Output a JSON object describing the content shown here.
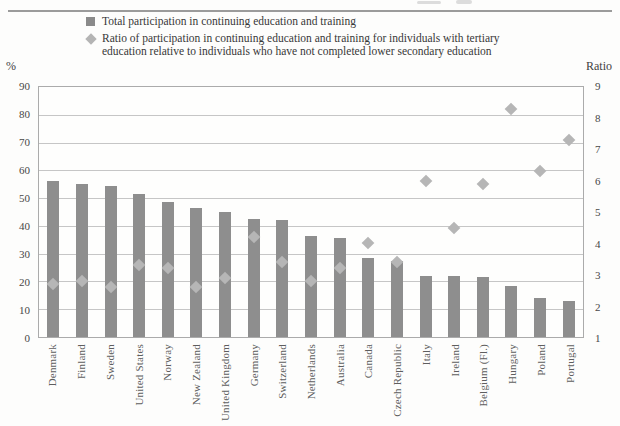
{
  "axis_titles": {
    "left": "%",
    "right": "Ratio"
  },
  "legend": {
    "items": [
      {
        "marker": "square-icon",
        "label": "Total participation in continuing education and training"
      },
      {
        "marker": "diamond-icon",
        "label_line1": "Ratio of participation in continuing education and training for individuals with tertiary",
        "label_line2": "education relative to individuals who have not completed lower secondary education"
      }
    ]
  },
  "colors": {
    "bar": "#8e8e8e",
    "diamond": "#b6b6b6",
    "gridline": "#c6c6c6",
    "plot_border": "#ababab",
    "tick_text": "#474747",
    "label_text": "#5e5e5e",
    "legend_text": "#383838",
    "top_rule": "#9b9b9b"
  },
  "chart_data": {
    "type": "bar",
    "categories": [
      "Denmark",
      "Finland",
      "Sweden",
      "United States",
      "Norway",
      "New Zealand",
      "United Kingdom",
      "Germany",
      "Switzerland",
      "Netherlands",
      "Australia",
      "Canada",
      "Czech Republic",
      "Italy",
      "Ireland",
      "Belgium (Fl.)",
      "Hungary",
      "Poland",
      "Portugal"
    ],
    "series": [
      {
        "name": "Total participation in continuing education and training",
        "type": "bar",
        "axis": "left",
        "values": [
          56,
          55,
          54.5,
          51.5,
          48.5,
          46.5,
          45,
          42.5,
          42,
          36.5,
          35.5,
          28.5,
          27.5,
          22,
          22,
          21.5,
          18.5,
          14,
          13
        ]
      },
      {
        "name": "Ratio of participation in continuing education and training for individuals with tertiary education relative to individuals who have not completed lower secondary education",
        "type": "scatter",
        "marker": "diamond",
        "axis": "right",
        "values": [
          2.7,
          2.8,
          2.6,
          3.3,
          3.2,
          2.6,
          2.9,
          4.2,
          3.4,
          2.8,
          3.2,
          4.0,
          3.4,
          6.0,
          4.5,
          5.9,
          8.3,
          6.3,
          7.3
        ]
      }
    ],
    "left_axis": {
      "label": "%",
      "min": 0,
      "max": 90,
      "ticks": [
        0,
        10,
        20,
        30,
        40,
        50,
        60,
        70,
        80,
        90
      ]
    },
    "right_axis": {
      "label": "Ratio",
      "min": 1,
      "max": 9,
      "ticks": [
        1,
        2,
        3,
        4,
        5,
        6,
        7,
        8,
        9
      ]
    },
    "grid": "horizontal",
    "legend_position": "top"
  }
}
